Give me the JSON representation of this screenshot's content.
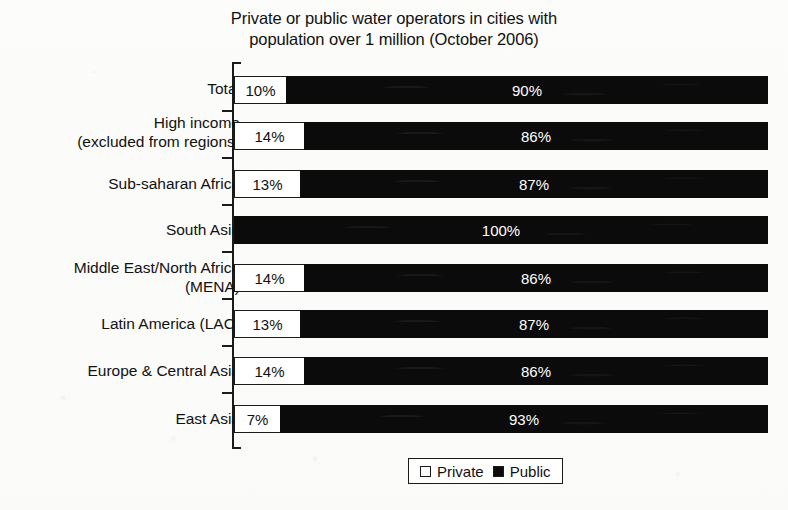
{
  "chart_data": {
    "type": "bar",
    "orientation": "horizontal",
    "stacked": true,
    "stack_total": 100,
    "title_line1": "Private or public water operators in cities with",
    "title_line2": "population over 1 million (October 2006)",
    "title": "Private or public water operators in cities with population over 1 million (October 2006)",
    "xlabel": "",
    "ylabel": "",
    "xlim": [
      0,
      100
    ],
    "grid": false,
    "legend_position": "bottom-center",
    "categories": [
      "Total",
      "High income\n(excluded from regions)",
      "Sub-saharan Africa",
      "South Asia",
      "Middle East/North Africa\n(MENA)",
      "Latin America (LAC)",
      "Europe & Central Asia",
      "East Asia"
    ],
    "series": [
      {
        "name": "Private",
        "color": "#ffffff",
        "values": [
          10,
          14,
          13,
          0,
          14,
          13,
          14,
          7
        ],
        "labels": [
          "10%",
          "14%",
          "13%",
          "",
          "14%",
          "13%",
          "14%",
          "7%"
        ]
      },
      {
        "name": "Public",
        "color": "#0b0b0b",
        "values": [
          90,
          86,
          87,
          100,
          86,
          87,
          86,
          93
        ],
        "labels": [
          "90%",
          "86%",
          "87%",
          "100%",
          "86%",
          "87%",
          "86%",
          "93%"
        ]
      }
    ],
    "legend": [
      "Private",
      "Public"
    ]
  },
  "rows": [
    {
      "label": "Total",
      "private_label": "10%",
      "public_label": "90%",
      "private_width": 52,
      "label_y": 79,
      "bar_y": 76,
      "tick_y": 110
    },
    {
      "label": "High income\n(excluded from regions)",
      "private_label": "14%",
      "public_label": "86%",
      "private_width": 70,
      "label_y": 113,
      "bar_y": 122,
      "tick_y": 157
    },
    {
      "label": "Sub-saharan Africa",
      "private_label": "13%",
      "public_label": "87%",
      "private_width": 66,
      "label_y": 174,
      "bar_y": 170,
      "tick_y": 204
    },
    {
      "label": "South Asia",
      "private_label": "",
      "public_label": "100%",
      "private_width": 0,
      "label_y": 220,
      "bar_y": 216,
      "tick_y": 251
    },
    {
      "label": "Middle East/North Africa\n(MENA)",
      "private_label": "14%",
      "public_label": "86%",
      "private_width": 70,
      "label_y": 258,
      "bar_y": 264,
      "tick_y": 298
    },
    {
      "label": "Latin America (LAC)",
      "private_label": "13%",
      "public_label": "87%",
      "private_width": 66,
      "label_y": 314,
      "bar_y": 310,
      "tick_y": 345
    },
    {
      "label": "Europe & Central Asia",
      "private_label": "14%",
      "public_label": "86%",
      "private_width": 70,
      "label_y": 361,
      "bar_y": 357,
      "tick_y": 392
    },
    {
      "label": "East Asia",
      "private_label": "7%",
      "public_label": "93%",
      "private_width": 46,
      "label_y": 409,
      "bar_y": 405,
      "tick_y": 440
    }
  ],
  "legend": {
    "private": "Private",
    "public": "Public"
  }
}
